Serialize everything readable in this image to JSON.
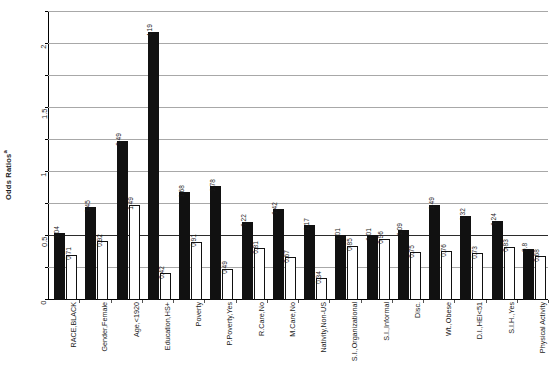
{
  "chart_data": {
    "type": "bar",
    "title": "",
    "xlabel": "",
    "ylabel": "Odds Ratios",
    "ylabel_superscript": "a",
    "ylim": [
      0,
      4.5
    ],
    "yticks": [
      "0",
      "0.5",
      "1",
      "1.5",
      "2",
      "2.5",
      "3",
      "3.5",
      "4",
      "4.5"
    ],
    "grid": true,
    "legend": "none",
    "reference_line": 1,
    "categories": [
      "RACE,BLACK",
      "Gender,Female",
      "Age,<1920",
      "Education,HS+",
      "Poverty",
      "P.Poverty,Yes",
      "R.Care,No",
      "M.Care,No",
      "Nativity,Non-US",
      "S.I.,Organizational",
      "S.I.,Informal",
      "Disc.",
      "Wt.,Obese",
      "D.I.,HEI<51",
      "S.I.H.,Yes",
      "Physical Activity"
    ],
    "series": [
      {
        "name": "filled",
        "style": "filled-black",
        "values": [
          1.04,
          1.45,
          2.49,
          4.19,
          1.68,
          1.78,
          1.22,
          1.42,
          1.17,
          1.01,
          1.01,
          1.09,
          1.49,
          1.32,
          1.24,
          0.8
        ],
        "labels": [
          "1.04",
          "1.45",
          "2.49",
          "4.19",
          "1.68",
          "1.78",
          "1.22",
          "1.42",
          "1.17",
          "1.01",
          "1.01",
          "1.09",
          "1.49",
          "1.32",
          "1.24",
          "0.8"
        ]
      },
      {
        "name": "hollow",
        "style": "hollow-white",
        "values": [
          0.71,
          0.92,
          1.49,
          0.42,
          0.91,
          0.49,
          0.81,
          0.67,
          0.34,
          0.85,
          0.96,
          0.75,
          0.76,
          0.73,
          0.83,
          0.68
        ],
        "labels": [
          "0.71",
          "0.92",
          "1.49",
          "0.42",
          "0.91",
          "0.49",
          "0.81",
          "0.67",
          "0.34",
          "0.85",
          "0.96",
          "0.75",
          "0.76",
          "0.73",
          "0.83",
          "0.68"
        ]
      }
    ]
  }
}
